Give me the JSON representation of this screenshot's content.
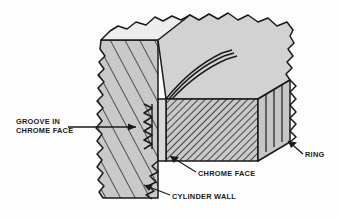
{
  "figure": {
    "type": "technical-cutaway-illustration",
    "background_color": "#fdfdfd",
    "line_color": "#1a1a1a",
    "fill_light": "#d2d2d2",
    "fill_mid": "#c2c2c2",
    "fill_dark": "#b0b0b0",
    "hatch_color": "#2b2b2b"
  },
  "labels": {
    "groove": "GROOVE IN\nCHROME FACE",
    "chrome_face": "CHROME FACE",
    "cylinder_wall": "CYLINDER WALL",
    "ring": "RING"
  },
  "parts": [
    {
      "name": "cylinder-wall",
      "label": "CYLINDER WALL",
      "hatch": "diagonal-coarse"
    },
    {
      "name": "ring",
      "label": "RING",
      "hatch": "diagonal-fine"
    },
    {
      "name": "chrome-face",
      "label": "CHROME FACE",
      "hatch": "none"
    },
    {
      "name": "groove-in-chrome-face",
      "label": "GROOVE IN CHROME FACE",
      "hatch": "sawtooth"
    }
  ]
}
